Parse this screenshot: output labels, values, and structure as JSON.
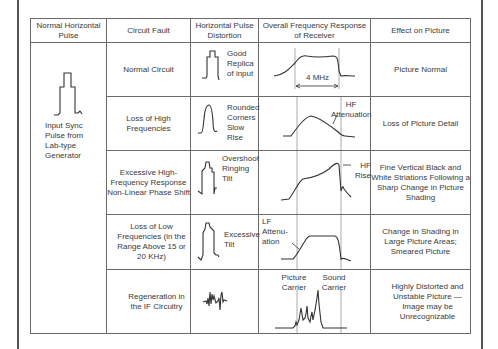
{
  "table": {
    "headers": [
      "Normal Horizontal Pulse",
      "Circuit Fault",
      "Horizontal Pulse Distortion",
      "Overall Frequency Response of Receiver",
      "Effect on Picture"
    ],
    "normal_pulse_caption": "Input Sync Pulse from Lab-type Generator",
    "rows": [
      {
        "fault": "Normal Circuit",
        "distortion": "Good Replica of input",
        "response_label": "4 MHz",
        "effect": "Picture Normal"
      },
      {
        "fault": "Loss of High Frequencies",
        "distortion": "Rounded Corners Slow Rise",
        "response_label": "HF Attenuation",
        "effect": "Loss of Picture Detail"
      },
      {
        "fault": "Excessive High-Frequency Response Non-Linear Phase Shift",
        "distortion": "Overshoot Ringing Tilt",
        "response_label": "HF Rise",
        "effect": "Fine Vertical Black and White Striations Following a Sharp Change in Picture Shading"
      },
      {
        "fault": "Loss of Low Frequencies (in the Range Above 15 or 20 KHz)",
        "distortion": "Excessive Tilt",
        "response_label": "LF Attenu-ation",
        "effect": "Change in Shading in Large Picture Areas; Smeared Picture"
      },
      {
        "fault": "Regeneration in the IF Circuitry",
        "distortion": "",
        "response_label_1": "Picture Carrier",
        "response_label_2": "Sound Carrier",
        "effect": "Highly Distorted and Unstable Picture — Image may be Unrecognizable"
      }
    ]
  },
  "icons": {
    "normal_pulse": "sync-pulse-waveform",
    "distortions": [
      "good-replica-waveform",
      "rounded-corners-waveform",
      "overshoot-ringing-waveform",
      "excessive-tilt-waveform",
      "regeneration-waveform"
    ],
    "responses": [
      "flat-response-curve",
      "hf-attenuation-curve",
      "hf-rise-curve",
      "lf-attenuation-curve",
      "carrier-spikes-curve"
    ]
  }
}
